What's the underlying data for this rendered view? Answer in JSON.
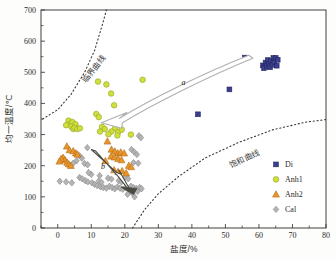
{
  "chart_data": {
    "type": "scatter",
    "title": "",
    "xlabel": "盐度/%",
    "ylabel": "均一温度/℃",
    "xlim": [
      -5,
      80
    ],
    "ylim": [
      0,
      700
    ],
    "xticks": [
      0,
      10,
      20,
      30,
      40,
      50,
      60,
      70,
      80
    ],
    "xtick_labels": [
      "0",
      "10",
      "20",
      "30",
      "40",
      "50",
      "60",
      "70",
      "80"
    ],
    "yticks": [
      0,
      100,
      200,
      300,
      400,
      500,
      600,
      700
    ],
    "ytick_labels": [
      "0",
      "100",
      "200",
      "300",
      "400",
      "500",
      "600",
      "700"
    ],
    "grid": false,
    "legend_position": "right-lower",
    "series": [
      {
        "name": "Di",
        "marker": "square",
        "color": "#3b3f8f",
        "edge": "#23265e",
        "points": [
          [
            55.8,
            547
          ],
          [
            61.2,
            522
          ],
          [
            61.5,
            513
          ],
          [
            62.0,
            531
          ],
          [
            62.4,
            520
          ],
          [
            62.6,
            539
          ],
          [
            63.0,
            527
          ],
          [
            63.3,
            516
          ],
          [
            63.6,
            536
          ],
          [
            64.0,
            524
          ],
          [
            64.3,
            546
          ],
          [
            64.6,
            533
          ],
          [
            65.0,
            546
          ],
          [
            65.3,
            521
          ],
          [
            65.6,
            540
          ],
          [
            51.2,
            445
          ],
          [
            41.8,
            365
          ]
        ]
      },
      {
        "name": "Anh1",
        "marker": "circle",
        "color": "#cfe03a",
        "edge": "#93a02a",
        "points": [
          [
            12.0,
            470
          ],
          [
            14.5,
            461
          ],
          [
            25.3,
            476
          ],
          [
            15.9,
            432
          ],
          [
            16.8,
            394
          ],
          [
            11.5,
            366
          ],
          [
            12.2,
            356
          ],
          [
            3.2,
            345
          ],
          [
            3.8,
            335
          ],
          [
            4.4,
            340
          ],
          [
            4.0,
            326
          ],
          [
            4.6,
            318
          ],
          [
            5.3,
            333
          ],
          [
            5.0,
            322
          ],
          [
            5.8,
            318
          ],
          [
            6.6,
            320
          ],
          [
            2.5,
            330
          ],
          [
            13.2,
            325
          ],
          [
            14.0,
            318
          ],
          [
            17.1,
            320
          ],
          [
            16.0,
            310
          ],
          [
            18.0,
            308
          ],
          [
            19.1,
            316
          ],
          [
            21.8,
            300
          ],
          [
            12.6,
            310
          ],
          [
            15.1,
            301
          ],
          [
            17.8,
            297
          ]
        ]
      },
      {
        "name": "Anh2",
        "marker": "triangle",
        "color": "#e8952c",
        "edge": "#b36a16",
        "points": [
          [
            2.7,
            262
          ],
          [
            3.5,
            250
          ],
          [
            4.6,
            247
          ],
          [
            5.4,
            240
          ],
          [
            5.9,
            236
          ],
          [
            1.6,
            226
          ],
          [
            2.2,
            218
          ],
          [
            2.8,
            210
          ],
          [
            3.3,
            205
          ],
          [
            3.9,
            200
          ],
          [
            1.0,
            222
          ],
          [
            0.5,
            214
          ],
          [
            14.8,
            278
          ],
          [
            16.0,
            252
          ],
          [
            17.0,
            246
          ],
          [
            17.9,
            240
          ],
          [
            18.8,
            243
          ],
          [
            19.8,
            240
          ],
          [
            15.9,
            230
          ],
          [
            16.9,
            227
          ],
          [
            18.0,
            222
          ],
          [
            19.0,
            218
          ],
          [
            14.2,
            215
          ],
          [
            16.8,
            186
          ],
          [
            18.0,
            180
          ],
          [
            19.2,
            183
          ],
          [
            20.4,
            176
          ],
          [
            21.2,
            200
          ],
          [
            21.9,
            196
          ]
        ]
      },
      {
        "name": "Cal",
        "marker": "diamond",
        "color": "#b4b4b4",
        "edge": "#8a8a8a",
        "points": [
          [
            8.8,
            258
          ],
          [
            24.2,
            296
          ],
          [
            24.8,
            290
          ],
          [
            22.0,
            252
          ],
          [
            22.8,
            244
          ],
          [
            23.6,
            236
          ],
          [
            6.5,
            232
          ],
          [
            7.2,
            224
          ],
          [
            5.6,
            216
          ],
          [
            4.6,
            208
          ],
          [
            8.0,
            207
          ],
          [
            8.9,
            203
          ],
          [
            22.6,
            210
          ],
          [
            24.0,
            208
          ],
          [
            0.6,
            150
          ],
          [
            2.5,
            148
          ],
          [
            4.2,
            145
          ],
          [
            6.5,
            162
          ],
          [
            7.3,
            158
          ],
          [
            8.2,
            152
          ],
          [
            9.0,
            148
          ],
          [
            10.2,
            145
          ],
          [
            11.0,
            140
          ],
          [
            11.8,
            136
          ],
          [
            12.8,
            132
          ],
          [
            13.6,
            130
          ],
          [
            14.5,
            128
          ],
          [
            15.4,
            134
          ],
          [
            16.2,
            130
          ],
          [
            17.0,
            126
          ],
          [
            17.8,
            132
          ],
          [
            18.6,
            128
          ],
          [
            19.4,
            124
          ],
          [
            20.2,
            130
          ],
          [
            21.0,
            127
          ],
          [
            21.8,
            134
          ],
          [
            22.6,
            130
          ],
          [
            23.4,
            127
          ],
          [
            21.5,
            118
          ],
          [
            22.3,
            112
          ],
          [
            20.8,
            108
          ],
          [
            22.9,
            100
          ],
          [
            23.8,
            118
          ],
          [
            24.4,
            130
          ],
          [
            25.0,
            126
          ],
          [
            12.2,
            150
          ],
          [
            13.0,
            147
          ],
          [
            18.2,
            152
          ],
          [
            19.0,
            148
          ],
          [
            15.0,
            160
          ],
          [
            16.0,
            157
          ],
          [
            20.0,
            162
          ],
          [
            21.0,
            158
          ],
          [
            12.5,
            168
          ],
          [
            10.0,
            172
          ],
          [
            9.2,
            178
          ]
        ]
      }
    ],
    "curves": [
      {
        "name": "critical-curve",
        "label": "临界曲线",
        "style": "dotted",
        "label_x": 11.5,
        "label_y": 505,
        "label_rotation": -52,
        "points": [
          [
            -4.5,
            350
          ],
          [
            0,
            380
          ],
          [
            4,
            430
          ],
          [
            8,
            500
          ],
          [
            11,
            570
          ],
          [
            13.5,
            660
          ],
          [
            14.5,
            700
          ]
        ]
      },
      {
        "name": "saturation-curve",
        "label": "饱和曲线",
        "style": "dotted",
        "label_x": 56,
        "label_y": 215,
        "label_rotation": -26,
        "points": [
          [
            22.3,
            0
          ],
          [
            26,
            60
          ],
          [
            30,
            110
          ],
          [
            36,
            165
          ],
          [
            44,
            225
          ],
          [
            54,
            275
          ],
          [
            64,
            315
          ],
          [
            74,
            340
          ],
          [
            80,
            348
          ]
        ]
      }
    ],
    "annotations": [
      {
        "name": "arrow-a-label",
        "text": "a",
        "x": 37.5,
        "y": 458
      },
      {
        "name": "arrow-b-label",
        "text": "b",
        "x": 13.5,
        "y": 190
      }
    ]
  },
  "legend": {
    "entries": [
      {
        "label": "Di",
        "marker": "square",
        "color": "#3b3f8f"
      },
      {
        "label": "Anh1",
        "marker": "circle",
        "color": "#cfe03a"
      },
      {
        "label": "Anh2",
        "marker": "triangle",
        "color": "#e8952c"
      },
      {
        "label": "Cal",
        "marker": "diamond",
        "color": "#b4b4b4"
      }
    ]
  },
  "colors": {
    "di": "#3b3f8f",
    "anh1": "#cfe03a",
    "anh2": "#e8952c",
    "cal": "#b4b4b4",
    "axis": "#2b2b2b",
    "arrow_a": "#b0b0b0",
    "arrow_b": "#4a4a42"
  }
}
